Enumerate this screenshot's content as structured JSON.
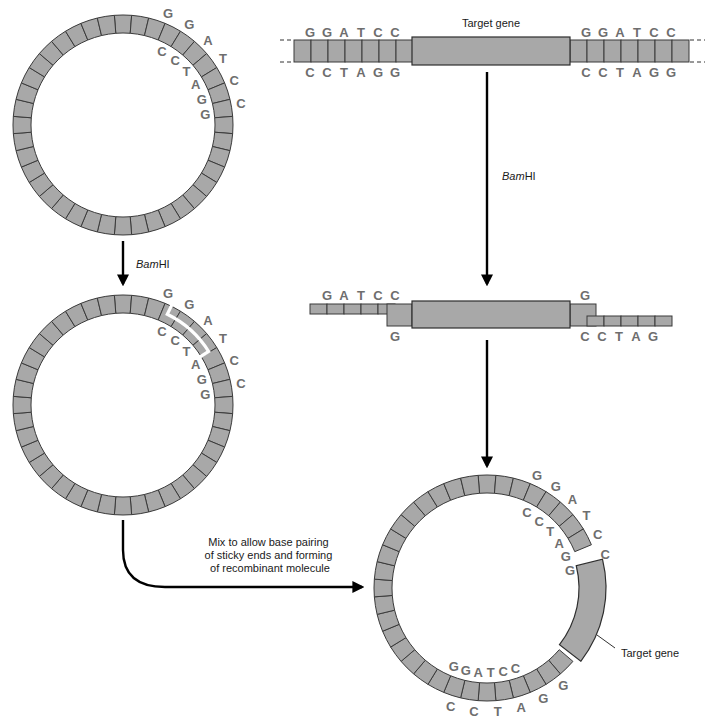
{
  "colors": {
    "strand": "#a8a8a8",
    "outline": "#2e2e2e",
    "base_text": "#6e6e6e",
    "arrow": "#000000"
  },
  "enzyme": {
    "italic": "Bam",
    "roman": "HI"
  },
  "linear_dna": {
    "label": "Target gene",
    "left_top": [
      "G",
      "G",
      "A",
      "T",
      "C",
      "C"
    ],
    "left_bottom": [
      "C",
      "C",
      "T",
      "A",
      "G",
      "G"
    ],
    "right_top": [
      "G",
      "G",
      "A",
      "T",
      "C",
      "C"
    ],
    "right_bottom": [
      "C",
      "C",
      "T",
      "A",
      "G",
      "G"
    ]
  },
  "cut_dna": {
    "left_top": [
      "G",
      "A",
      "T",
      "C",
      "C"
    ],
    "left_bottom": [
      "G"
    ],
    "right_top": [
      "G"
    ],
    "right_bottom": [
      "C",
      "C",
      "T",
      "A",
      "G"
    ]
  },
  "plasmid": {
    "outer_seq": [
      "G",
      "G",
      "A",
      "T",
      "C",
      "C"
    ],
    "inner_seq": [
      "C",
      "C",
      "T",
      "A",
      "G",
      "G"
    ]
  },
  "recombinant": {
    "site1_outer": [
      "G",
      "G",
      "A",
      "T",
      "C",
      "C"
    ],
    "site1_inner": [
      "C",
      "C",
      "T",
      "A",
      "G",
      "G"
    ],
    "site2_outer": [
      "G",
      "G",
      "A",
      "T",
      "C",
      "C"
    ],
    "site2_inner": [
      "C",
      "C",
      "T",
      "A",
      "G",
      "G"
    ],
    "gene_label": "Target gene"
  },
  "mix_caption": [
    "Mix to allow base pairing",
    "of sticky ends and forming",
    "of recombinant molecule"
  ]
}
